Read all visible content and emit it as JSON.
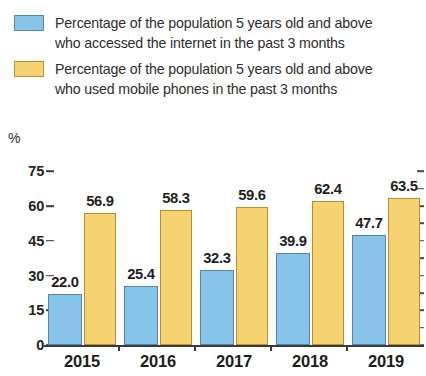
{
  "legend": {
    "items": [
      {
        "swatch": "blue",
        "color": "#86c5e9",
        "line1": "Percentage of the population 5 years old and above",
        "line2": "who accessed the internet in the past 3 months"
      },
      {
        "swatch": "yellow",
        "color": "#f6d271",
        "line1": "Percentage of the population 5 years old and above",
        "line2": "who used mobile phones in the past 3 months"
      }
    ]
  },
  "axis": {
    "y_unit": "%",
    "y_ticks": [
      "75",
      "60",
      "45",
      "30",
      "15",
      "0"
    ]
  },
  "chart_data": {
    "type": "bar",
    "title": "",
    "subtitle": "",
    "xlabel": "",
    "ylabel": "%",
    "ylim": [
      0,
      75
    ],
    "ytick_values": [
      0,
      15,
      30,
      45,
      60,
      75
    ],
    "grid": false,
    "legend_position": "top",
    "categories": [
      "2015",
      "2016",
      "2017",
      "2018",
      "2019"
    ],
    "series": [
      {
        "name": "Percentage of the population 5 years old and above who accessed the internet in the past 3 months",
        "color": "#86c5e9",
        "values": [
          22.0,
          25.4,
          32.3,
          39.9,
          47.7
        ],
        "labels": [
          "22.0",
          "25.4",
          "32.3",
          "39.9",
          "47.7"
        ]
      },
      {
        "name": "Percentage of the population 5 years old and above who used mobile phones in the past 3 months",
        "color": "#f6d271",
        "values": [
          56.9,
          58.3,
          59.6,
          62.4,
          63.5
        ],
        "labels": [
          "56.9",
          "58.3",
          "59.6",
          "62.4",
          "63.5"
        ]
      }
    ]
  }
}
